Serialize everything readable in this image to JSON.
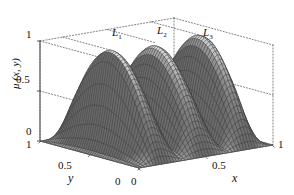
{
  "figure": {
    "background_color": "#ffffff",
    "ink_color": "#1a1a1a"
  },
  "axes": {
    "z": {
      "title": "μ (x, y)",
      "ticks": [
        "1",
        "0.5",
        "0"
      ],
      "values": [
        1,
        0.5,
        0
      ],
      "range": [
        0,
        1
      ]
    },
    "y": {
      "title": "y",
      "ticks": [
        "1",
        "0.5",
        "0"
      ],
      "values": [
        1,
        0.5,
        0
      ],
      "range": [
        0,
        1
      ]
    },
    "x": {
      "title": "x",
      "ticks": [
        "0",
        "0.5",
        "1"
      ],
      "values": [
        0,
        0.5,
        1
      ],
      "range": [
        0,
        1
      ]
    }
  },
  "ridge_labels": [
    {
      "base": "L",
      "sub": "1"
    },
    {
      "base": "L",
      "sub": "2"
    },
    {
      "base": "L",
      "sub": "3"
    }
  ],
  "chart_data": {
    "type": "surface",
    "title": "",
    "xlabel": "x",
    "ylabel": "y",
    "zlabel": "μ (x, y)",
    "xlim": [
      0,
      1
    ],
    "ylim": [
      0,
      1
    ],
    "zlim": [
      0,
      1
    ],
    "grid": false,
    "legend": "none",
    "annotations": [
      "L₁",
      "L₂",
      "L₃"
    ],
    "surface_model": {
      "formula": "mu(x,y) = sin(pi*y) * max over k of bump_k(x)",
      "ridge_centers_x": [
        0.17,
        0.5,
        0.83
      ],
      "ridge_peak_z": [
        1.0,
        0.97,
        1.0
      ],
      "ridge_half_width_x": 0.17,
      "y_profile": "sin(pi*y)",
      "grid_nx": 46,
      "grid_ny": 46
    },
    "mesh_style": {
      "line_color": "#3a3a3a",
      "line_width": 0.35,
      "face_color_top": "#ffffff",
      "face_color_floor": "#6b6b6b"
    },
    "samples": {
      "x": [
        0,
        0.1,
        0.17,
        0.25,
        0.33,
        0.42,
        0.5,
        0.58,
        0.67,
        0.75,
        0.83,
        0.9,
        1
      ],
      "z_at_y_0p5": [
        0,
        0.72,
        1.0,
        0.78,
        0.63,
        0.87,
        0.97,
        0.87,
        0.63,
        0.78,
        1.0,
        0.72,
        0
      ]
    }
  }
}
